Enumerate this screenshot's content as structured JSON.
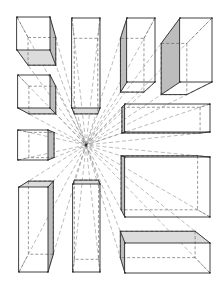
{
  "diagram": {
    "type": "one-point-perspective-study",
    "vanishing_point": {
      "x": 86,
      "y": 145
    },
    "colors": {
      "line": "#2a2a2a",
      "hidden": "#555555",
      "ray": "#666666",
      "shade": "#bdbdbd",
      "shade_light": "#dcdcdc",
      "background": "#ffffff"
    },
    "boxes": [
      {
        "name": "box-top-left-cube",
        "front": [
          17,
          17,
          50,
          50
        ],
        "depth": 0.16,
        "shade": "bottom-right"
      },
      {
        "name": "box-mid-left-cube",
        "front": [
          18,
          75,
          50,
          108
        ],
        "depth": 0.16,
        "shade": "right-bottom"
      },
      {
        "name": "box-small-left-cube",
        "front": [
          18,
          130,
          48,
          160
        ],
        "depth": 0.16,
        "shade": "right"
      },
      {
        "name": "box-bottom-left-tall",
        "front": [
          19,
          187,
          48,
          272
        ],
        "depth": 0.14,
        "shade": "top-right"
      },
      {
        "name": "box-top-center-tall",
        "front": [
          72,
          18,
          100,
          108
        ],
        "depth": 0.16,
        "shade": "bottom"
      },
      {
        "name": "box-bottom-center-tall",
        "front": [
          73,
          184,
          100,
          272
        ],
        "depth": 0.1,
        "shade": "top"
      },
      {
        "name": "box-top-right-1",
        "front": [
          127,
          18,
          155,
          82
        ],
        "depth": 0.16,
        "shade": "left"
      },
      {
        "name": "box-top-right-2",
        "front": [
          180,
          18,
          212,
          82
        ],
        "depth": 0.2,
        "shade": "left"
      },
      {
        "name": "box-right-wide",
        "front": [
          125,
          104,
          210,
          132
        ],
        "depth": 0.08,
        "shade": "left"
      },
      {
        "name": "box-right-large",
        "front": [
          125,
          157,
          210,
          217
        ],
        "depth": 0.1,
        "shade": "left"
      },
      {
        "name": "box-bottom-right",
        "front": [
          125,
          243,
          210,
          273
        ],
        "depth": 0.12,
        "shade": "left-top"
      }
    ]
  }
}
